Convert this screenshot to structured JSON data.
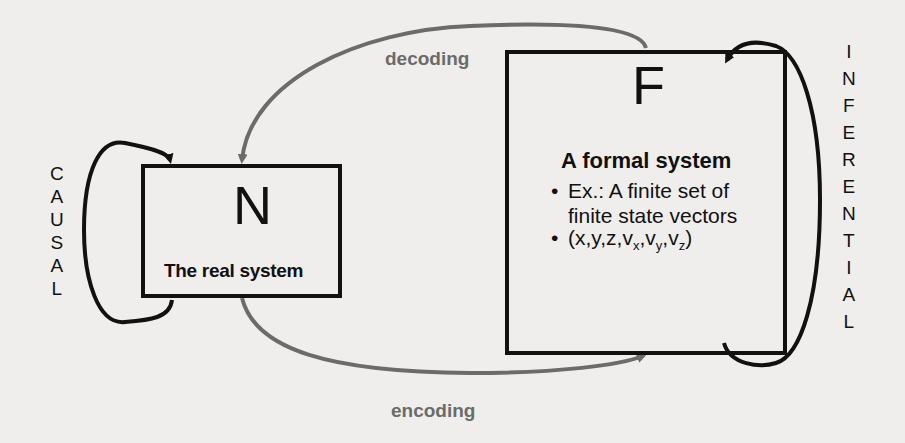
{
  "diagram": {
    "colors": {
      "background": "#efeeec",
      "box_stroke": "#111111",
      "loop_stroke": "#111111",
      "mapping_arrow": "#6b6b6b"
    },
    "natural_system": {
      "symbol": "N",
      "caption": "The real system"
    },
    "formal_system": {
      "symbol": "F",
      "title": "A formal system",
      "bullets": [
        {
          "line1": "Ex.: A finite set of",
          "line2": "finite state vectors"
        },
        {
          "text_prefix": "(x,y,z,v",
          "sub1": "x",
          "mid1": ",v",
          "sub2": "y",
          "mid2": ",v",
          "sub3": "z",
          "suffix": ")"
        }
      ],
      "bullet_char": "•"
    },
    "causal_label": [
      "C",
      "A",
      "U",
      "S",
      "A",
      "L"
    ],
    "inferential_label": [
      "I",
      "N",
      "F",
      "E",
      "R",
      "E",
      "N",
      "T",
      "I",
      "A",
      "L"
    ],
    "arrows": {
      "decoding": "decoding",
      "encoding": "encoding"
    }
  }
}
